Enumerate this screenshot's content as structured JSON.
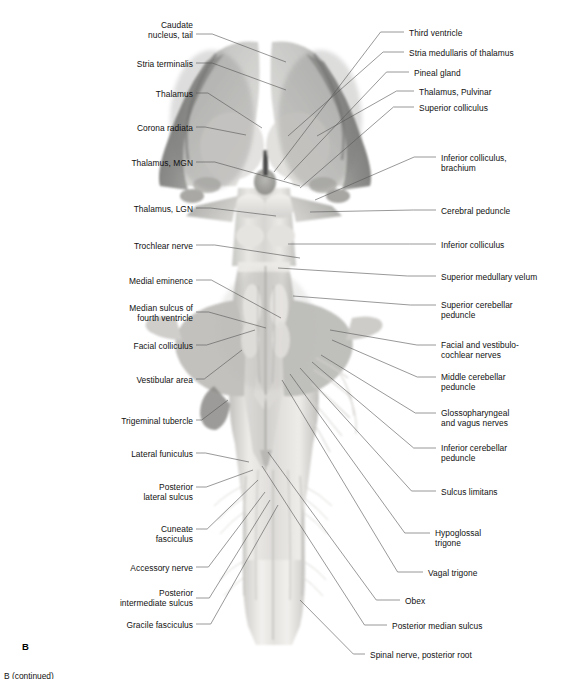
{
  "figure": {
    "panel_letter": "B",
    "caption_partial": "B (continued)",
    "modality": "grayscale anatomical photograph",
    "background_color": "#ffffff",
    "leader_line_color": "#5a5a5a",
    "text_color": "#111111"
  },
  "labels_left": [
    {
      "id": "caudate-nucleus-tail",
      "text": "Caudate\nnucleus, tail",
      "x": 75,
      "y": 20,
      "w": 118,
      "anchor_x": 196,
      "anchor_y": 34,
      "target_x": 286,
      "target_y": 62
    },
    {
      "id": "stria-terminalis",
      "text": "Stria terminalis",
      "x": 55,
      "y": 59,
      "w": 138,
      "anchor_x": 196,
      "anchor_y": 63,
      "target_x": 286,
      "target_y": 90
    },
    {
      "id": "thalamus",
      "text": "Thalamus",
      "x": 55,
      "y": 89,
      "w": 138,
      "anchor_x": 196,
      "anchor_y": 93,
      "target_x": 262,
      "target_y": 128
    },
    {
      "id": "corona-radiata",
      "text": "Corona radiata",
      "x": 45,
      "y": 123,
      "w": 148,
      "anchor_x": 196,
      "anchor_y": 127,
      "target_x": 246,
      "target_y": 135
    },
    {
      "id": "thalamus-mgn",
      "text": "Thalamus, MGN",
      "x": 35,
      "y": 158,
      "w": 158,
      "anchor_x": 196,
      "anchor_y": 162,
      "target_x": 300,
      "target_y": 186
    },
    {
      "id": "thalamus-lgn",
      "text": "Thalamus, LGN",
      "x": 35,
      "y": 204,
      "w": 158,
      "anchor_x": 196,
      "anchor_y": 208,
      "target_x": 276,
      "target_y": 216
    },
    {
      "id": "trochlear-nerve",
      "text": "Trochlear nerve",
      "x": 30,
      "y": 241,
      "w": 163,
      "anchor_x": 196,
      "anchor_y": 245,
      "target_x": 300,
      "target_y": 258
    },
    {
      "id": "medial-eminence",
      "text": "Medial eminence",
      "x": 22,
      "y": 276,
      "w": 171,
      "anchor_x": 196,
      "anchor_y": 280,
      "target_x": 281,
      "target_y": 318
    },
    {
      "id": "median-sulcus-fourth-ventricle",
      "text": "Median sulcus of\nfourth ventricle",
      "x": 22,
      "y": 303,
      "w": 171,
      "anchor_x": 196,
      "anchor_y": 312,
      "target_x": 266,
      "target_y": 328
    },
    {
      "id": "facial-colliculus",
      "text": "Facial colliculus",
      "x": 28,
      "y": 341,
      "w": 165,
      "anchor_x": 196,
      "anchor_y": 345,
      "target_x": 255,
      "target_y": 330
    },
    {
      "id": "vestibular-area",
      "text": "Vestibular area",
      "x": 30,
      "y": 375,
      "w": 163,
      "anchor_x": 196,
      "anchor_y": 379,
      "target_x": 242,
      "target_y": 350
    },
    {
      "id": "trigeminal-tubercle",
      "text": "Trigeminal tubercle",
      "x": 20,
      "y": 416,
      "w": 173,
      "anchor_x": 196,
      "anchor_y": 420,
      "target_x": 228,
      "target_y": 400
    },
    {
      "id": "lateral-funiculus",
      "text": "Lateral funiculus",
      "x": 28,
      "y": 449,
      "w": 165,
      "anchor_x": 196,
      "anchor_y": 453,
      "target_x": 249,
      "target_y": 462
    },
    {
      "id": "posterior-lateral-sulcus",
      "text": "Posterior\nlateral sulcus",
      "x": 38,
      "y": 482,
      "w": 155,
      "anchor_x": 196,
      "anchor_y": 487,
      "target_x": 253,
      "target_y": 470
    },
    {
      "id": "cuneate-fasciculus",
      "text": "Cuneate\nfasciculus",
      "x": 50,
      "y": 524,
      "w": 143,
      "anchor_x": 196,
      "anchor_y": 529,
      "target_x": 258,
      "target_y": 480
    },
    {
      "id": "accessory-nerve",
      "text": "Accessory nerve",
      "x": 50,
      "y": 563,
      "w": 143,
      "anchor_x": 196,
      "anchor_y": 567,
      "target_x": 265,
      "target_y": 492
    },
    {
      "id": "posterior-intermediate-sulcus",
      "text": "Posterior\nintermediate sulcus",
      "x": 55,
      "y": 588,
      "w": 138,
      "anchor_x": 196,
      "anchor_y": 598,
      "target_x": 270,
      "target_y": 500
    },
    {
      "id": "gracile-fasciculus",
      "text": "Gracile fasciculus",
      "x": 55,
      "y": 620,
      "w": 138,
      "anchor_x": 196,
      "anchor_y": 624,
      "target_x": 278,
      "target_y": 505
    }
  ],
  "labels_right": [
    {
      "id": "third-ventricle",
      "text": "Third ventricle",
      "x": 409,
      "y": 28,
      "w": 158,
      "anchor_x": 404,
      "anchor_y": 32,
      "target_x": 274,
      "target_y": 172
    },
    {
      "id": "stria-medullaris-of-thalamus",
      "text": "Stria medullaris of thalamus",
      "x": 409,
      "y": 48,
      "w": 158,
      "anchor_x": 404,
      "anchor_y": 52,
      "target_x": 288,
      "target_y": 136
    },
    {
      "id": "pineal-gland",
      "text": "Pineal gland",
      "x": 414,
      "y": 68,
      "w": 153,
      "anchor_x": 409,
      "anchor_y": 72,
      "target_x": 284,
      "target_y": 180
    },
    {
      "id": "thalamus-pulvinar",
      "text": "Thalamus, Pulvinar",
      "x": 419,
      "y": 87,
      "w": 148,
      "anchor_x": 414,
      "anchor_y": 91,
      "target_x": 317,
      "target_y": 136
    },
    {
      "id": "superior-colliculus",
      "text": "Superior colliculus",
      "x": 419,
      "y": 103,
      "w": 148,
      "anchor_x": 414,
      "anchor_y": 107,
      "target_x": 300,
      "target_y": 188
    },
    {
      "id": "inferior-colliculus-brachium",
      "text": "Inferior colliculus,\nbrachium",
      "x": 441,
      "y": 153,
      "w": 126,
      "anchor_x": 436,
      "anchor_y": 157,
      "target_x": 315,
      "target_y": 200
    },
    {
      "id": "cerebral-peduncle",
      "text": "Cerebral peduncle",
      "x": 441,
      "y": 206,
      "w": 126,
      "anchor_x": 436,
      "anchor_y": 210,
      "target_x": 310,
      "target_y": 212
    },
    {
      "id": "inferior-colliculus",
      "text": "Inferior colliculus",
      "x": 441,
      "y": 240,
      "w": 126,
      "anchor_x": 436,
      "anchor_y": 244,
      "target_x": 288,
      "target_y": 244
    },
    {
      "id": "superior-medullary-velum",
      "text": "Superior medullary velum",
      "x": 441,
      "y": 272,
      "w": 126,
      "anchor_x": 436,
      "anchor_y": 276,
      "target_x": 278,
      "target_y": 268
    },
    {
      "id": "superior-cerebellar-peduncle",
      "text": "Superior cerebellar\npeduncle",
      "x": 441,
      "y": 300,
      "w": 126,
      "anchor_x": 436,
      "anchor_y": 305,
      "target_x": 293,
      "target_y": 296
    },
    {
      "id": "facial-and-vestibulocochlear-nerves",
      "text": "Facial and vestibulo-\ncochlear nerves",
      "x": 441,
      "y": 340,
      "w": 126,
      "anchor_x": 436,
      "anchor_y": 345,
      "target_x": 330,
      "target_y": 330
    },
    {
      "id": "middle-cerebellar-peduncle",
      "text": "Middle cerebellar\npeduncle",
      "x": 441,
      "y": 372,
      "w": 126,
      "anchor_x": 436,
      "anchor_y": 377,
      "target_x": 332,
      "target_y": 340
    },
    {
      "id": "glossopharyngeal-and-vagus-nerves",
      "text": "Glossopharyngeal\nand vagus nerves",
      "x": 441,
      "y": 408,
      "w": 126,
      "anchor_x": 436,
      "anchor_y": 413,
      "target_x": 321,
      "target_y": 355
    },
    {
      "id": "inferior-cerebellar-peduncle",
      "text": "Inferior cerebellar\npeduncle",
      "x": 441,
      "y": 443,
      "w": 126,
      "anchor_x": 436,
      "anchor_y": 448,
      "target_x": 312,
      "target_y": 362
    },
    {
      "id": "sulcus-limitans",
      "text": "Sulcus limitans",
      "x": 441,
      "y": 487,
      "w": 126,
      "anchor_x": 436,
      "anchor_y": 491,
      "target_x": 300,
      "target_y": 368
    },
    {
      "id": "hypoglossal-trigone",
      "text": "Hypoglossal\ntrigone",
      "x": 435,
      "y": 528,
      "w": 132,
      "anchor_x": 430,
      "anchor_y": 533,
      "target_x": 290,
      "target_y": 374
    },
    {
      "id": "vagal-trigone",
      "text": "Vagal trigone",
      "x": 428,
      "y": 568,
      "w": 139,
      "anchor_x": 423,
      "anchor_y": 572,
      "target_x": 282,
      "target_y": 380
    },
    {
      "id": "obex",
      "text": "Obex",
      "x": 405,
      "y": 596,
      "w": 162,
      "anchor_x": 400,
      "anchor_y": 600,
      "target_x": 268,
      "target_y": 452
    },
    {
      "id": "posterior-median-sulcus",
      "text": "Posterior median sulcus",
      "x": 392,
      "y": 621,
      "w": 175,
      "anchor_x": 387,
      "anchor_y": 625,
      "target_x": 262,
      "target_y": 466
    },
    {
      "id": "spinal-nerve-posterior-root",
      "text": "Spinal nerve, posterior root",
      "x": 370,
      "y": 650,
      "w": 197,
      "anchor_x": 365,
      "anchor_y": 654,
      "target_x": 300,
      "target_y": 600
    }
  ]
}
